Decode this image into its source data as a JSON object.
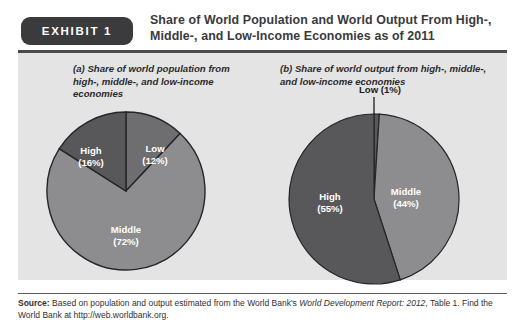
{
  "exhibit": {
    "badge_label": "EXHIBIT 1",
    "title": "Share of World Population and World Output From High-, Middle-, and Low-Income Economies as of 2011"
  },
  "source": {
    "label": "Source:",
    "text_before_italic": " Based on population and output estimated from the World Bank's ",
    "italic_text": "World Development Report: 2012",
    "text_after_italic": ", Table 1. Find the World Bank at http://web.worldbank.org."
  },
  "colors": {
    "panel_background": "#e4e4e4",
    "badge_background": "#3b3b3d",
    "high_slice": "#58585a",
    "middle_slice": "#8d8d8f",
    "low_slice": "#6e6e70",
    "slice_outline": "#262628",
    "title_text": "#3a3a3c",
    "label_text": "#ffffff"
  },
  "chart_data": [
    {
      "type": "pie",
      "id": "a",
      "title": "(a) Share of world population from high-, middle-, and low-income economies",
      "caption_prefix": "(a)",
      "caption_rest": " Share of world population from high-, middle-, and low-income economies",
      "categories": [
        "Low",
        "Middle",
        "High"
      ],
      "values": [
        12,
        72,
        16
      ],
      "unit": "%",
      "start_angle_deg": 0,
      "direction": "clockwise",
      "legend": "none",
      "slices": [
        {
          "name": "Low",
          "label": "Low",
          "value_label": "(12%)",
          "value": 12,
          "color": "#6e6e70",
          "label_x": 113,
          "label_y": 60
        },
        {
          "name": "Middle",
          "label": "Middle",
          "value_label": "(72%)",
          "value": 72,
          "color": "#8d8d8f",
          "label_x": 82,
          "label_y": 120
        },
        {
          "name": "High",
          "label": "High",
          "value_label": "(16%)",
          "value": 16,
          "color": "#58585a",
          "label_x": 51,
          "label_y": 62
        }
      ]
    },
    {
      "type": "pie",
      "id": "b",
      "title": "(b) Share of world output from high-, middle-, and low-income economies",
      "caption_prefix": "(b)",
      "caption_rest": " Share of world output from high-, middle-, and low-income economies",
      "categories": [
        "Low",
        "Middle",
        "High"
      ],
      "values": [
        1,
        44,
        55
      ],
      "unit": "%",
      "start_angle_deg": 0,
      "direction": "clockwise",
      "legend": "none",
      "slices": [
        {
          "name": "Low",
          "label": "Low (1%)",
          "value": 1,
          "color": "#58585a",
          "callout": true,
          "label_x": 96,
          "label_y": -12
        },
        {
          "name": "Middle",
          "label": "Middle",
          "value_label": "(44%)",
          "value": 44,
          "color": "#8d8d8f",
          "label_x": 124,
          "label_y": 94
        },
        {
          "name": "High",
          "label": "High",
          "value_label": "(55%)",
          "value": 55,
          "color": "#58585a",
          "label_x": 48,
          "label_y": 100
        }
      ]
    }
  ]
}
